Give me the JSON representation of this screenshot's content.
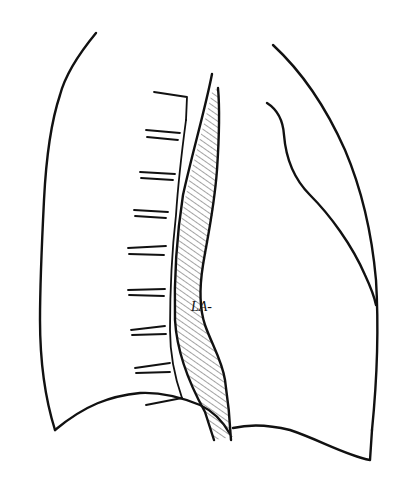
{
  "figure": {
    "labels": [
      {
        "id": "left-atrium",
        "text": "LA-"
      }
    ],
    "structures": [
      "thoracic-outline-posterior",
      "thoracic-outline-anterior",
      "heart-border",
      "vertebral-ribs",
      "left-atrium-band",
      "diaphragm"
    ],
    "colors": {
      "ink": "#111111",
      "hatch": "#333333",
      "background": "#ffffff"
    }
  }
}
